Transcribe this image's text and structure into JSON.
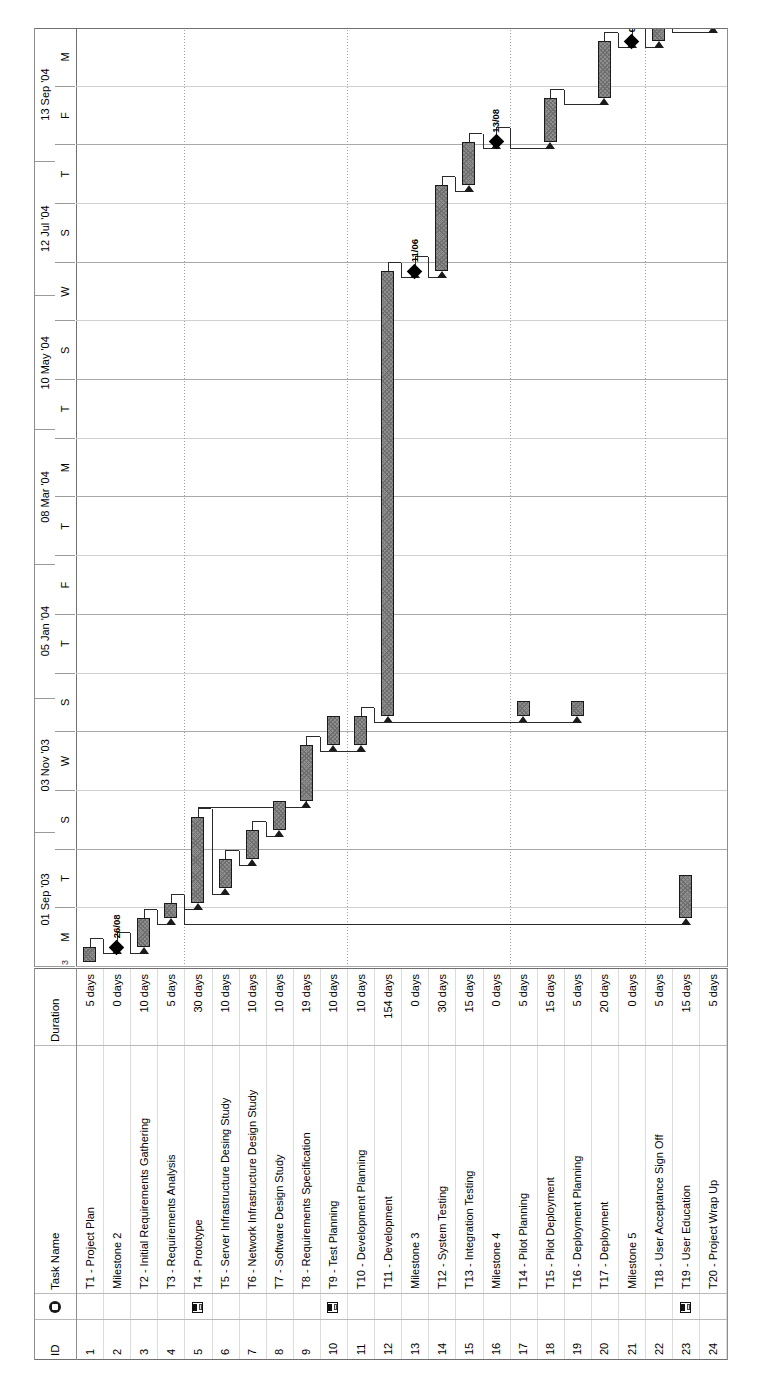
{
  "document": {
    "type": "gantt-chart",
    "application": "Microsoft Project",
    "orientation": "rotated-90-ccw",
    "edge_marker": "3"
  },
  "table": {
    "columns": [
      {
        "key": "id",
        "label": "ID"
      },
      {
        "key": "indicator",
        "label": "",
        "icon": "info-icon"
      },
      {
        "key": "name",
        "label": "Task Name"
      },
      {
        "key": "duration",
        "label": "Duration"
      }
    ],
    "rows": [
      {
        "id": "1",
        "name": "T1 - Project Plan",
        "duration": "5 days",
        "indicator": ""
      },
      {
        "id": "2",
        "name": "Milestone 2",
        "duration": "0 days",
        "indicator": ""
      },
      {
        "id": "3",
        "name": "T2 - Initial Requirements Gathering",
        "duration": "10 days",
        "indicator": ""
      },
      {
        "id": "4",
        "name": "T3 - Requirements Analysis",
        "duration": "5 days",
        "indicator": ""
      },
      {
        "id": "5",
        "name": "T4 - Prototype",
        "duration": "30 days",
        "indicator": "note-icon"
      },
      {
        "id": "6",
        "name": "T5 - Server Infrastructure Desing Study",
        "duration": "10 days",
        "indicator": ""
      },
      {
        "id": "7",
        "name": "T6 - Network Infrastructure Design Study",
        "duration": "10 days",
        "indicator": ""
      },
      {
        "id": "8",
        "name": "T7 - Software Design Study",
        "duration": "10 days",
        "indicator": ""
      },
      {
        "id": "9",
        "name": "T8 - Requirements Specification",
        "duration": "19 days",
        "indicator": ""
      },
      {
        "id": "10",
        "name": "T9 - Test Planning",
        "duration": "10 days",
        "indicator": "note-icon"
      },
      {
        "id": "11",
        "name": "T10 - Development Planning",
        "duration": "10 days",
        "indicator": ""
      },
      {
        "id": "12",
        "name": "T11 - Development",
        "duration": "154 days",
        "indicator": ""
      },
      {
        "id": "13",
        "name": "Milestone 3",
        "duration": "0 days",
        "indicator": ""
      },
      {
        "id": "14",
        "name": "T12 - System Testing",
        "duration": "30 days",
        "indicator": ""
      },
      {
        "id": "15",
        "name": "T13 - Integration Testing",
        "duration": "15 days",
        "indicator": ""
      },
      {
        "id": "16",
        "name": "Milestone 4",
        "duration": "0 days",
        "indicator": ""
      },
      {
        "id": "17",
        "name": "T14 - Pilot Planning",
        "duration": "5 days",
        "indicator": ""
      },
      {
        "id": "18",
        "name": "T15 - Pilot Deployment",
        "duration": "15 days",
        "indicator": ""
      },
      {
        "id": "19",
        "name": "T16 - Deployment Planning",
        "duration": "5 days",
        "indicator": ""
      },
      {
        "id": "20",
        "name": "T17 - Deployment",
        "duration": "20 days",
        "indicator": ""
      },
      {
        "id": "21",
        "name": "Milestone 5",
        "duration": "0 days",
        "indicator": ""
      },
      {
        "id": "22",
        "name": "T18 - User Acceptance Sign Off",
        "duration": "5 days",
        "indicator": ""
      },
      {
        "id": "23",
        "name": "T19 - User Education",
        "duration": "15 days",
        "indicator": "note-icon"
      },
      {
        "id": "24",
        "name": "T20 - Project Wrap Up",
        "duration": "5 days",
        "indicator": ""
      }
    ]
  },
  "timeline": {
    "major_ticks": [
      "01 Sep '03",
      "03 Nov '03",
      "05 Jan '04",
      "08 Mar '04",
      "10 May '04",
      "12 Jul '04",
      "13 Sep '04"
    ],
    "minor_ticks": [
      "M",
      "T",
      "S",
      "W",
      "S",
      "T",
      "F",
      "T",
      "M",
      "T",
      "S",
      "W",
      "S",
      "T",
      "F",
      "M"
    ]
  },
  "chart_data": {
    "type": "bar",
    "title": "",
    "xlabel": "",
    "ylabel": "",
    "axis_start": "2003-08-25",
    "axis_end": "2004-09-27",
    "categories": [
      "T1 - Project Plan",
      "Milestone 2",
      "T2 - Initial Requirements Gathering",
      "T3 - Requirements Analysis",
      "T4 - Prototype",
      "T5 - Server Infrastructure Desing Study",
      "T6 - Network Infrastructure Design Study",
      "T7 - Software Design Study",
      "T8 - Requirements Specification",
      "T9 - Test Planning",
      "T10 - Development Planning",
      "T11 - Development",
      "Milestone 3",
      "T12 - System Testing",
      "T13 - Integration Testing",
      "Milestone 4",
      "T14 - Pilot Planning",
      "T15 - Pilot Deployment",
      "T16 - Deployment Planning",
      "T17 - Deployment",
      "Milestone 5",
      "T18 - User Acceptance Sign Off",
      "T19 - User Education",
      "T20 - Project Wrap Up"
    ],
    "values": [
      5,
      0,
      10,
      5,
      30,
      10,
      10,
      10,
      19,
      10,
      10,
      154,
      0,
      30,
      15,
      0,
      5,
      15,
      5,
      20,
      0,
      5,
      15,
      5
    ],
    "ylabel_units": "days",
    "bars": [
      {
        "row": 1,
        "left": 0.5,
        "width": 1.6,
        "kind": "bar"
      },
      {
        "row": 2,
        "left": 2.1,
        "width": 0,
        "kind": "milestone",
        "label": "26/08"
      },
      {
        "row": 3,
        "left": 2.1,
        "width": 3.1,
        "kind": "bar"
      },
      {
        "row": 4,
        "left": 5.2,
        "width": 1.6,
        "kind": "bar"
      },
      {
        "row": 5,
        "left": 6.8,
        "width": 9.2,
        "kind": "bar"
      },
      {
        "row": 6,
        "left": 8.4,
        "width": 3.1,
        "kind": "bar"
      },
      {
        "row": 7,
        "left": 11.5,
        "width": 3.1,
        "kind": "bar"
      },
      {
        "row": 8,
        "left": 14.6,
        "width": 3.1,
        "kind": "bar"
      },
      {
        "row": 9,
        "left": 17.7,
        "width": 5.9,
        "kind": "bar"
      },
      {
        "row": 10,
        "left": 23.6,
        "width": 3.1,
        "kind": "bar"
      },
      {
        "row": 11,
        "left": 23.6,
        "width": 3.1,
        "kind": "bar"
      },
      {
        "row": 12,
        "left": 26.7,
        "width": 47.4,
        "kind": "bar"
      },
      {
        "row": 13,
        "left": 74.1,
        "width": 0,
        "kind": "milestone",
        "label": "11/06"
      },
      {
        "row": 14,
        "left": 74.1,
        "width": 9.2,
        "kind": "bar"
      },
      {
        "row": 15,
        "left": 83.3,
        "width": 4.6,
        "kind": "bar"
      },
      {
        "row": 16,
        "left": 87.9,
        "width": 0,
        "kind": "milestone",
        "label": "13/08"
      },
      {
        "row": 17,
        "left": 26.7,
        "width": 1.6,
        "kind": "bar"
      },
      {
        "row": 18,
        "left": 87.9,
        "width": 4.6,
        "kind": "bar"
      },
      {
        "row": 19,
        "left": 26.7,
        "width": 1.6,
        "kind": "bar"
      },
      {
        "row": 20,
        "left": 92.5,
        "width": 6.1,
        "kind": "bar"
      },
      {
        "row": 21,
        "left": 98.6,
        "width": 0,
        "kind": "milestone",
        "label": "01/10"
      },
      {
        "row": 22,
        "left": 98.6,
        "width": 1.6,
        "kind": "bar"
      },
      {
        "row": 23,
        "left": 5.2,
        "width": 4.6,
        "kind": "bar"
      },
      {
        "row": 24,
        "left": 100.2,
        "width": 1.6,
        "kind": "bar"
      }
    ],
    "milestone_labels": [
      "26/08",
      "11/06",
      "13/08",
      "01/10"
    ],
    "grid": true,
    "legend": "none"
  }
}
